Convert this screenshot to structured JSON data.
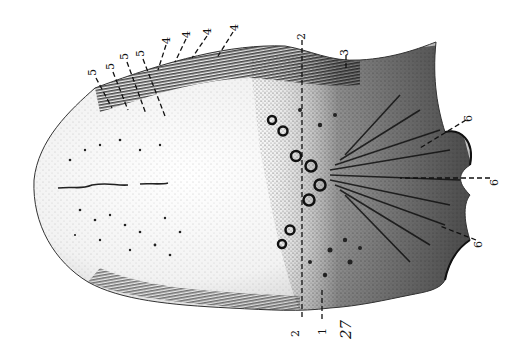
{
  "figure": {
    "figure_number": "27",
    "colors": {
      "ink": "#111111",
      "paper": "#ffffff",
      "shade": "#555555"
    },
    "labels": [
      {
        "id": "l5a",
        "text": "5",
        "x": 92,
        "y": 72
      },
      {
        "id": "l5b",
        "text": "5",
        "x": 110,
        "y": 66
      },
      {
        "id": "l5c",
        "text": "5",
        "x": 124,
        "y": 56
      },
      {
        "id": "l5d",
        "text": "5",
        "x": 140,
        "y": 53
      },
      {
        "id": "l4a",
        "text": "4",
        "x": 166,
        "y": 40
      },
      {
        "id": "l4b",
        "text": "4",
        "x": 186,
        "y": 34
      },
      {
        "id": "l4c",
        "text": "4",
        "x": 207,
        "y": 31
      },
      {
        "id": "l4d",
        "text": "4",
        "x": 234,
        "y": 27
      },
      {
        "id": "l2top",
        "text": "2",
        "x": 301,
        "y": 36
      },
      {
        "id": "l3",
        "text": "3",
        "x": 344,
        "y": 52
      },
      {
        "id": "l6top",
        "text": "6",
        "x": 468,
        "y": 118
      },
      {
        "id": "l6mid",
        "text": "6",
        "x": 494,
        "y": 182
      },
      {
        "id": "l6bot",
        "text": "6",
        "x": 478,
        "y": 244
      },
      {
        "id": "l2bot",
        "text": "2",
        "x": 295,
        "y": 333
      },
      {
        "id": "l1",
        "text": "1",
        "x": 322,
        "y": 331
      }
    ]
  }
}
